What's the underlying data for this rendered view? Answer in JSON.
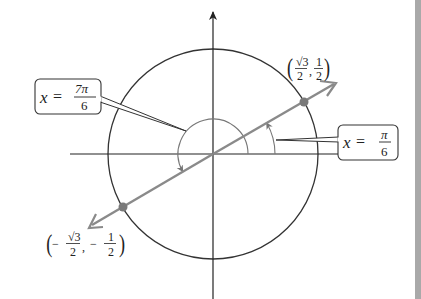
{
  "figure": {
    "type": "unit-circle-diagram",
    "colors": {
      "axis": "#222222",
      "circle": "#333333",
      "terminal_line": "#8a8a8a",
      "points": "#7a7a7a",
      "callout_border": "#333333",
      "edge_strip": "#a9a9a9"
    },
    "callouts": {
      "left": {
        "var": "x",
        "eq": "=",
        "num": "7π",
        "den": "6"
      },
      "right": {
        "var": "x",
        "eq": "=",
        "num": "π",
        "den": "6"
      }
    },
    "points": {
      "upper_right": {
        "x_num": "√3",
        "x_den": "2",
        "sep": ",",
        "y_num": "1",
        "y_den": "2",
        "open": "(",
        "close": ")"
      },
      "lower_left": {
        "x_num": "√3",
        "x_den": "2",
        "x_sign": "−",
        "sep": ",",
        "y_num": "1",
        "y_den": "2",
        "y_sign": "−",
        "open": "(",
        "close": ")"
      }
    }
  }
}
